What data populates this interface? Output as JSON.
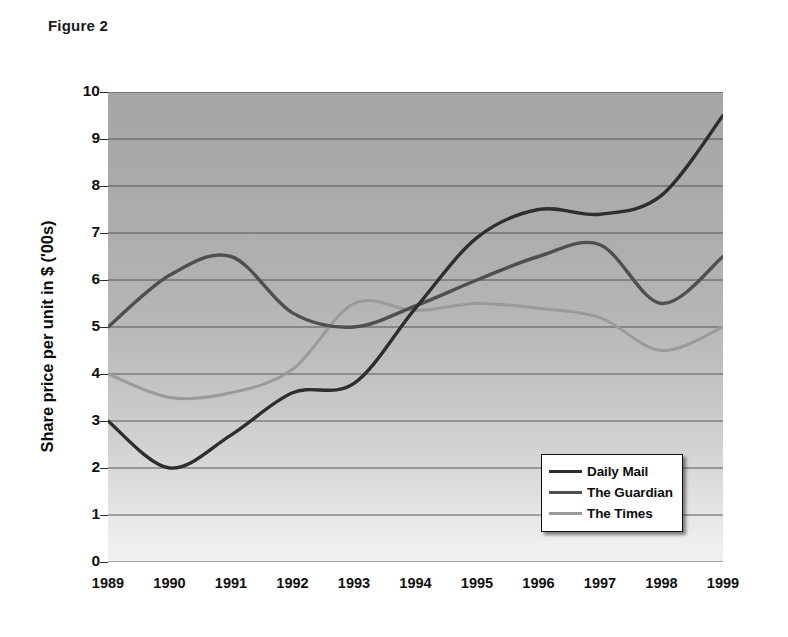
{
  "figure": {
    "caption": "Figure 2"
  },
  "chart_data": {
    "type": "line",
    "title": "Figure 2",
    "xlabel": "",
    "ylabel": "Share price per unit in $ ('00s)",
    "x": [
      1989,
      1990,
      1991,
      1992,
      1993,
      1994,
      1995,
      1996,
      1997,
      1998,
      1999
    ],
    "categories": [
      "1989",
      "1990",
      "1991",
      "1992",
      "1993",
      "1994",
      "1995",
      "1996",
      "1997",
      "1998",
      "1999"
    ],
    "xlim": [
      1989,
      1999
    ],
    "ylim": [
      0,
      10
    ],
    "y_ticks": [
      0,
      1,
      2,
      3,
      4,
      5,
      6,
      7,
      8,
      9,
      10
    ],
    "y_tick_labels": [
      "0",
      "1",
      "2",
      "3",
      "4",
      "5",
      "6",
      "7",
      "8",
      "9",
      "10"
    ],
    "grid": true,
    "grid_axis": "y",
    "legend_position": "lower right",
    "plot_background": "vertical gradient dark grey (top) to light grey (bottom)",
    "series": [
      {
        "name": "Daily Mail",
        "color": "#2e2e2e",
        "values": [
          3.0,
          2.0,
          2.7,
          3.6,
          3.8,
          5.4,
          6.9,
          7.5,
          7.4,
          7.8,
          9.5
        ]
      },
      {
        "name": "The Guardian",
        "color": "#4f4f4f",
        "values": [
          5.0,
          6.1,
          6.5,
          5.3,
          5.0,
          5.45,
          6.0,
          6.5,
          6.75,
          5.5,
          6.5
        ]
      },
      {
        "name": "The Times",
        "color": "#9a9a9a",
        "values": [
          4.0,
          3.5,
          3.6,
          4.1,
          5.5,
          5.35,
          5.5,
          5.4,
          5.2,
          4.5,
          5.0
        ]
      }
    ]
  },
  "legend": {
    "items": [
      {
        "label": "Daily Mail",
        "color": "#2e2e2e"
      },
      {
        "label": "The Guardian",
        "color": "#4f4f4f"
      },
      {
        "label": "The Times",
        "color": "#9a9a9a"
      }
    ]
  },
  "axes": {
    "y_title": "Share price per unit in $ ('00s)"
  }
}
